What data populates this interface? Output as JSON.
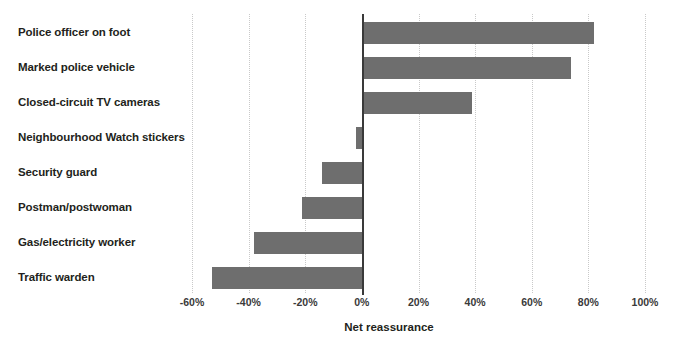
{
  "chart_data": {
    "type": "bar",
    "orientation": "horizontal",
    "title": "",
    "xlabel": "Net reassurance",
    "ylabel": "",
    "categories": [
      "Police officer on foot",
      "Marked police vehicle",
      "Closed-circuit TV cameras",
      "Neighbourhood Watch stickers",
      "Security guard",
      "Postman/postwoman",
      "Gas/electricity worker",
      "Traffic warden"
    ],
    "values": [
      82,
      74,
      39,
      -2,
      -14,
      -21,
      -38,
      -53
    ],
    "value_unit": "%",
    "xlim": [
      -60,
      100
    ],
    "xticks": [
      -60,
      -40,
      -20,
      0,
      20,
      40,
      60,
      80,
      100
    ],
    "xticklabels": [
      "-60%",
      "-40%",
      "-20%",
      "0%",
      "20%",
      "40%",
      "60%",
      "80%",
      "100%"
    ],
    "grid": "vertical-dotted",
    "legend": "none",
    "colors": {
      "bar": "#6e6e6e",
      "gridline": "#c9c9c9",
      "zero_axis": "#3a3a3a",
      "label_text": "#231f20",
      "tick_text": "#3a3a3a",
      "background": "#ffffff"
    }
  }
}
